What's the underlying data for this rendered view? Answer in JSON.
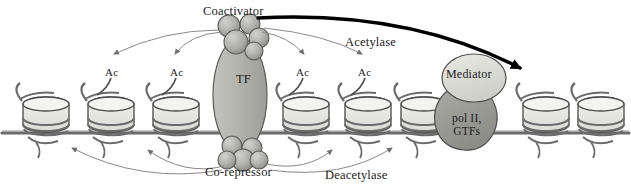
{
  "diagram": {
    "background_color": "#ffffff",
    "width": 631,
    "height": 195
  },
  "labels": {
    "coactivator": "Coactivator",
    "acetylase": "Acetylase",
    "tf": "TF",
    "mediator": "Mediator",
    "pol_line1": "pol II,",
    "pol_line2": "GTFs",
    "corepressor": "Co-repressor",
    "deacetylase": "Deacetylase",
    "ac": "Ac"
  },
  "acetyl_marks": [
    {
      "label": "Ac",
      "x": 105,
      "y": 66
    },
    {
      "label": "Ac",
      "x": 170,
      "y": 66
    },
    {
      "label": "Ac",
      "x": 296,
      "y": 66
    },
    {
      "label": "Ac",
      "x": 358,
      "y": 66
    }
  ],
  "nucleosomes": [
    {
      "x": 45,
      "y": 118
    },
    {
      "x": 110,
      "y": 118
    },
    {
      "x": 175,
      "y": 118
    },
    {
      "x": 305,
      "y": 118
    },
    {
      "x": 367,
      "y": 118
    },
    {
      "x": 423,
      "y": 118
    },
    {
      "x": 545,
      "y": 118
    },
    {
      "x": 600,
      "y": 118
    }
  ],
  "colors": {
    "nucleosome_fill": "#e9e9e4",
    "nucleosome_top": "#f2f2ee",
    "nucleosome_stroke": "#4b4b4b",
    "dna_stroke": "#6b6b6b",
    "tf_fill": "#b7b7b2",
    "tf_stroke": "#5a5a5a",
    "sphere_fill": "#b0b0ab",
    "sphere_stroke": "#5a5a5a",
    "mediator_fill": "#dcdcd6",
    "mediator_stroke": "#4f4f4f",
    "polii_fill": "#9c9c97",
    "polii_stroke": "#4f4f4f",
    "thin_arrow": "#777777",
    "thick_arrow": "#000000",
    "text": "#1a1a1a"
  }
}
